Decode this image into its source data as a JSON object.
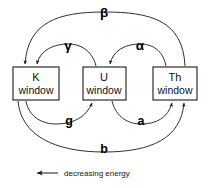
{
  "diagram": {
    "background_color": "#ffffff",
    "line_color": "#1a1a1a",
    "text_color": "#111111",
    "nodes": [
      {
        "id": "k",
        "line1": "K",
        "line2": "window"
      },
      {
        "id": "u",
        "line1": "U",
        "line2": "window"
      },
      {
        "id": "th",
        "line1": "Th",
        "line2": "window"
      }
    ],
    "edges": [
      {
        "id": "beta",
        "label": "β",
        "from": "th",
        "to": "k",
        "side": "top",
        "symbol_name": "beta-symbol"
      },
      {
        "id": "gamma",
        "label": "γ",
        "from": "u",
        "to": "k",
        "side": "top",
        "symbol_name": "gamma-symbol"
      },
      {
        "id": "alpha",
        "label": "α",
        "from": "th",
        "to": "u",
        "side": "top",
        "symbol_name": "alpha-symbol"
      },
      {
        "id": "g",
        "label": "g",
        "from": "k",
        "to": "u",
        "side": "bottom",
        "symbol_name": "g-label"
      },
      {
        "id": "a",
        "label": "a",
        "from": "u",
        "to": "th",
        "side": "bottom",
        "symbol_name": "a-label"
      },
      {
        "id": "b",
        "label": "b",
        "from": "k",
        "to": "th",
        "side": "bottom",
        "symbol_name": "b-label"
      }
    ],
    "caption": {
      "arrow_glyph": "←",
      "text": "decreasing   energy"
    }
  }
}
